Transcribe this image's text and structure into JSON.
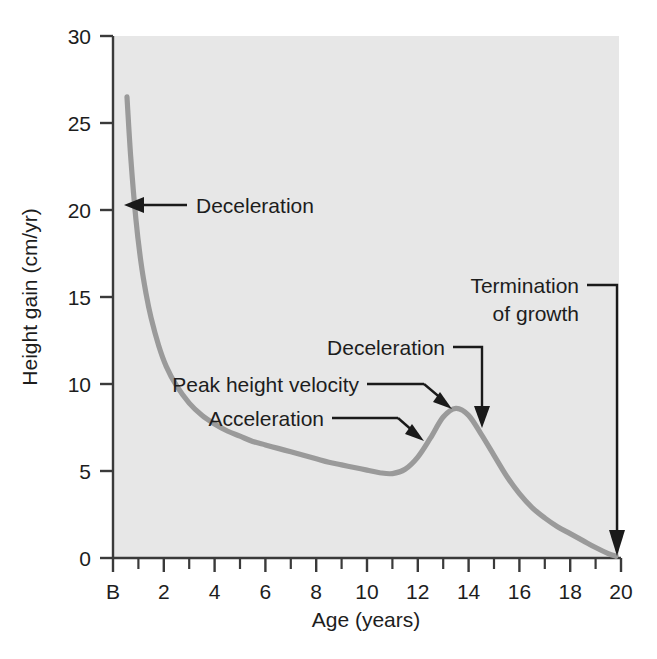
{
  "chart_data": {
    "type": "line",
    "title": "",
    "subtitle": "",
    "xlabel": "Age (years)",
    "ylabel": "Height gain (cm/yr)",
    "xlim": [
      0,
      20
    ],
    "ylim": [
      0,
      30
    ],
    "grid": false,
    "legend": "none",
    "series": [
      {
        "name": "Height velocity",
        "color": "#9a9a9a",
        "x": [
          0.55,
          0.7,
          0.9,
          1.1,
          1.3,
          1.5,
          1.8,
          2.1,
          2.5,
          3.0,
          3.5,
          4.0,
          4.5,
          5.0,
          5.5,
          6.0,
          6.5,
          7.0,
          7.5,
          8.0,
          8.5,
          9.0,
          9.5,
          10.0,
          10.5,
          11.0,
          11.5,
          12.0,
          12.5,
          13.0,
          13.5,
          14.0,
          14.5,
          15.0,
          15.5,
          16.0,
          16.5,
          17.0,
          17.5,
          18.0,
          18.5,
          19.0,
          19.5,
          19.8
        ],
        "y": [
          26.5,
          23.0,
          19.5,
          17.0,
          15.2,
          13.8,
          12.2,
          11.0,
          9.9,
          8.9,
          8.2,
          7.7,
          7.3,
          7.0,
          6.7,
          6.5,
          6.3,
          6.1,
          5.9,
          5.7,
          5.5,
          5.35,
          5.2,
          5.05,
          4.9,
          4.85,
          5.1,
          5.8,
          6.9,
          8.1,
          8.6,
          8.2,
          7.1,
          5.9,
          4.7,
          3.7,
          2.9,
          2.3,
          1.8,
          1.4,
          1.0,
          0.6,
          0.25,
          0.1
        ]
      }
    ],
    "y_ticks": [
      0,
      5,
      10,
      15,
      20,
      25,
      30
    ],
    "y_tick_labels": [
      "0",
      "5",
      "10",
      "15",
      "20",
      "25",
      "30"
    ],
    "x_ticks": [
      0,
      2,
      4,
      6,
      8,
      10,
      12,
      14,
      16,
      18,
      20
    ],
    "x_tick_labels": [
      "B",
      "2",
      "4",
      "6",
      "8",
      "10",
      "12",
      "14",
      "16",
      "18",
      "20"
    ],
    "x_minor_ticks": [
      1,
      3,
      5,
      7,
      9,
      11,
      13,
      15,
      17,
      19
    ],
    "annotations": [
      {
        "id": "deceleration-early",
        "text": "Deceleration",
        "x": 2.0,
        "y": 20.0,
        "points_to_x": 0.75,
        "points_to_y": 20.0,
        "arrow": "left"
      },
      {
        "id": "peak-height-velocity",
        "text": "Peak height velocity",
        "x": 8.1,
        "y": 10.2,
        "points_to_x": 13.0,
        "points_to_y": 8.2,
        "arrow": "elbow-down-right"
      },
      {
        "id": "acceleration",
        "text": "Acceleration",
        "x": 8.6,
        "y": 8.3,
        "points_to_x": 12.6,
        "points_to_y": 6.6,
        "arrow": "elbow-down-right"
      },
      {
        "id": "deceleration-pubertal",
        "text": "Deceleration",
        "x": 11.5,
        "y": 11.9,
        "points_to_x": 14.6,
        "points_to_y": 8.0,
        "arrow": "elbow-down"
      },
      {
        "id": "termination-of-growth",
        "text_line1": "Termination",
        "text_line2": "of growth",
        "x": 16.7,
        "y": 15.2,
        "points_to_x": 19.85,
        "points_to_y": 0.3,
        "arrow": "elbow-down"
      }
    ],
    "colors": {
      "curve": "#9a9a9a",
      "axis": "#3a3a3a",
      "annotation": "#1a1a1a",
      "plot_background": "#e7e7e7",
      "page_background": "#ffffff"
    }
  }
}
